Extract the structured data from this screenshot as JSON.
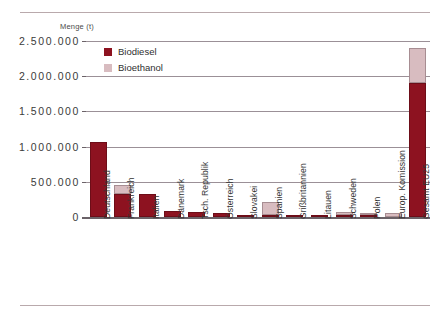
{
  "chart_data": {
    "type": "bar",
    "stacked": true,
    "title": "",
    "subtitle": "",
    "xlabel": "",
    "ylabel": "Menge (t)",
    "ylim": [
      0,
      2500000
    ],
    "ytick_labels": [
      "2.500.000",
      "2.000.000",
      "1.500.000",
      "1.000.000",
      "500.000",
      "0"
    ],
    "ytick_values": [
      2500000,
      2000000,
      1500000,
      1000000,
      500000,
      0
    ],
    "grid": true,
    "legend_position": "top-left-inside",
    "categories": [
      "Deutschland",
      "Frankreich",
      "Italien",
      "Dänemark",
      "Tsch. Republik",
      "Österreich",
      "Slovakei",
      "Spanien",
      "Grißbritannien",
      "Litauen",
      "Schweden",
      "Polen",
      "Europ. Komission",
      "Gesamt EU25"
    ],
    "series": [
      {
        "name": "Biodiesel",
        "color": "#8d1220",
        "values": [
          1070000,
          320000,
          320000,
          85000,
          70000,
          60000,
          35000,
          15000,
          10000,
          8000,
          2000,
          20000,
          0,
          1900000
        ]
      },
      {
        "name": "Bioethanol",
        "color": "#d8bcc0",
        "values": [
          0,
          130000,
          0,
          0,
          0,
          0,
          0,
          180000,
          0,
          0,
          45000,
          8000,
          60000,
          500000
        ]
      }
    ],
    "totals": [
      1070000,
      450000,
      320000,
      85000,
      70000,
      60000,
      35000,
      195000,
      10000,
      8000,
      47000,
      28000,
      60000,
      2400000
    ]
  },
  "legend": {
    "items": [
      {
        "label": "Biodiesel",
        "swatch": "diesel"
      },
      {
        "label": "Bioethanol",
        "swatch": "ethanol"
      }
    ]
  },
  "colors": {
    "biodiesel": "#8d1220",
    "bioethanol": "#d8bcc0",
    "rule": "#b9a9ac",
    "gridline": "#9b9097",
    "text": "#3b3b3b"
  }
}
